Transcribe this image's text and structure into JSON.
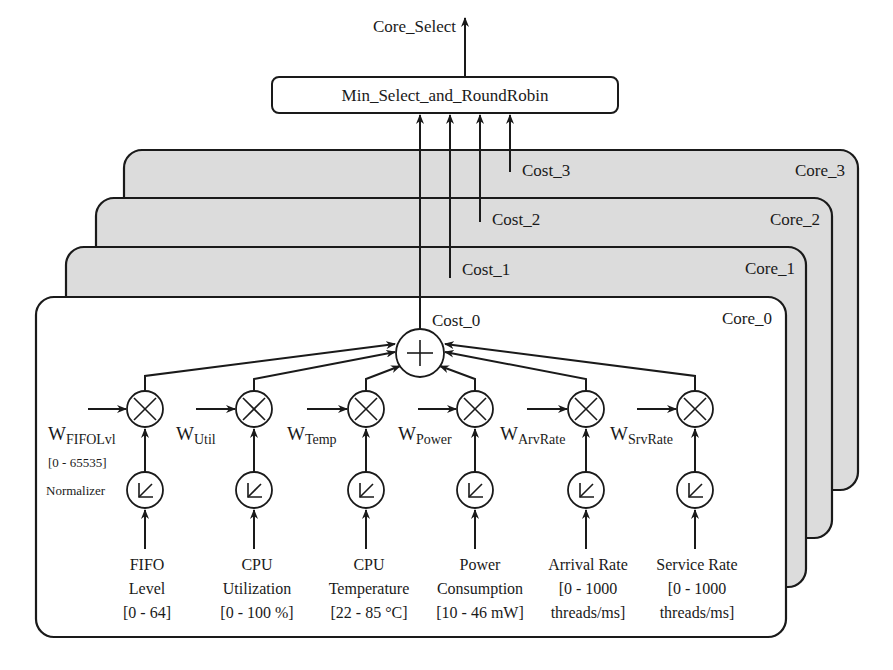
{
  "output": {
    "label": "Core_Select"
  },
  "selector": {
    "label": "Min_Select_and_RoundRobin"
  },
  "cores": [
    {
      "label": "Core_0",
      "cost_label": "Cost_0"
    },
    {
      "label": "Core_1",
      "cost_label": "Cost_1"
    },
    {
      "label": "Core_2",
      "cost_label": "Cost_2"
    },
    {
      "label": "Core_3",
      "cost_label": "Cost_3"
    }
  ],
  "colors": {
    "core_back_fill": "#dcdcdc",
    "core_front_fill": "#ffffff",
    "stroke": "#1a1a1a"
  },
  "weight_range_label": "[0 - 65535]",
  "normalizer_label": "Normalizer",
  "inputs": [
    {
      "weight_base": "W",
      "weight_sub": "FIFOLvl",
      "name_line1": "FIFO",
      "name_line2": "Level",
      "range": "[0 - 64]",
      "range_line2": ""
    },
    {
      "weight_base": "W",
      "weight_sub": "Util",
      "name_line1": "CPU",
      "name_line2": "Utilization",
      "range": "[0 - 100 %]",
      "range_line2": ""
    },
    {
      "weight_base": "W",
      "weight_sub": "Temp",
      "name_line1": "CPU",
      "name_line2": "Temperature",
      "range": "[22 - 85 °C]",
      "range_line2": ""
    },
    {
      "weight_base": "W",
      "weight_sub": "Power",
      "name_line1": "Power",
      "name_line2": "Consumption",
      "range": "[10 - 46 mW]",
      "range_line2": ""
    },
    {
      "weight_base": "W",
      "weight_sub": "ArvRate",
      "name_line1": "Arrival Rate",
      "name_line2": "[0 - 1000",
      "range": "threads/ms]",
      "range_line2": ""
    },
    {
      "weight_base": "W",
      "weight_sub": "SrvRate",
      "name_line1": "Service Rate",
      "name_line2": "[0 - 1000",
      "range": "threads/ms]",
      "range_line2": ""
    }
  ],
  "symbols": {
    "adder": "+",
    "multiplier": "×",
    "normalizer": "↙"
  }
}
